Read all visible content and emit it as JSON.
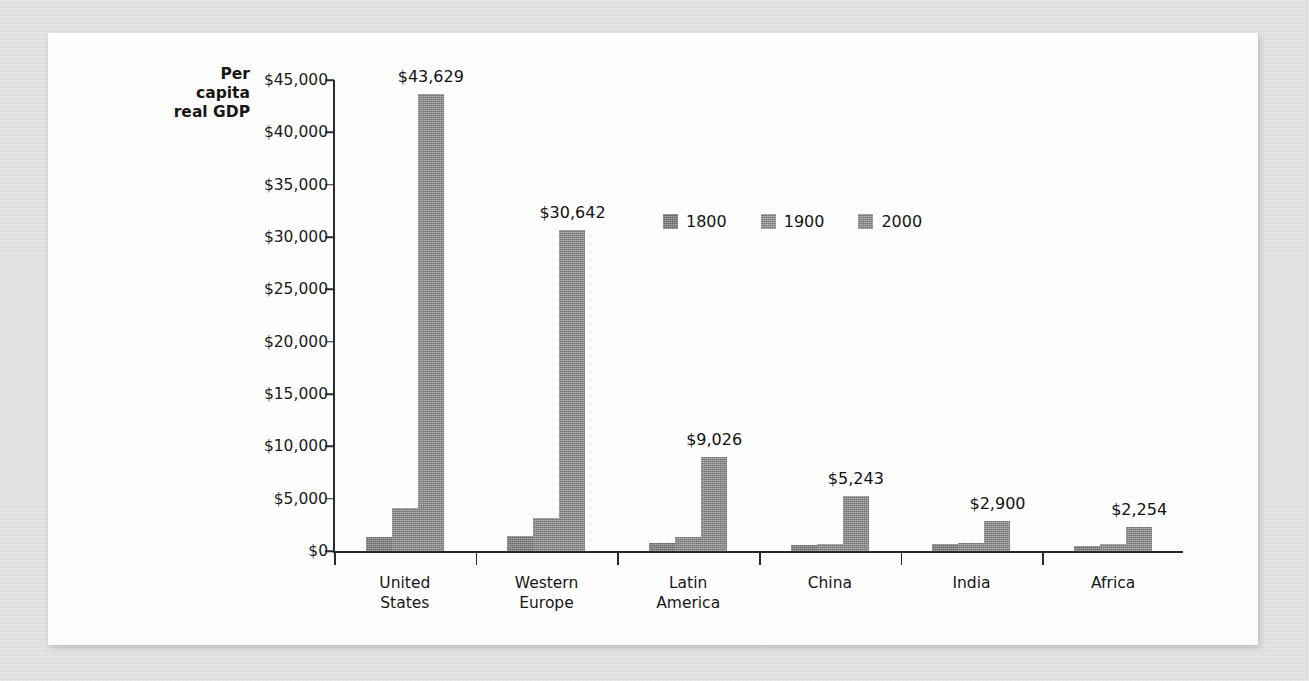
{
  "figure": {
    "background_color": "#dcdcdc",
    "card_color": "#fefefe"
  },
  "chart_data": {
    "type": "bar",
    "title": "",
    "subtitle": "",
    "xlabel": "",
    "ylabel": "Per\ncapita\nreal GDP",
    "categories": [
      "United\nStates",
      "Western\nEurope",
      "Latin\nAmerica",
      "China",
      "India",
      "Africa"
    ],
    "series": [
      {
        "name": "1800",
        "color": "#7d7d7d",
        "values": [
          1300,
          1400,
          800,
          600,
          700,
          500
        ]
      },
      {
        "name": "1900",
        "color": "#8a8a8a",
        "values": [
          4100,
          3200,
          1300,
          700,
          800,
          700
        ]
      },
      {
        "name": "2000",
        "color": "#8a8a8a",
        "values": [
          43629,
          30642,
          9026,
          5243,
          2900,
          2254
        ]
      }
    ],
    "value_labels": [
      "$43,629",
      "$30,642",
      "$9,026",
      "$5,243",
      "$2,900",
      "$2,254"
    ],
    "value_label_series": "2000",
    "ylim": [
      0,
      45000
    ],
    "ytick_values": [
      0,
      5000,
      10000,
      15000,
      20000,
      25000,
      30000,
      35000,
      40000,
      45000
    ],
    "ytick_labels": [
      "$0",
      "$5,000",
      "$10,000",
      "$15,000",
      "$20,000",
      "$25,000",
      "$30,000",
      "$35,000",
      "$40,000",
      "$45,000"
    ],
    "grid": false,
    "legend_position": "upper-center",
    "legend_entries": [
      "1800",
      "1900",
      "2000"
    ]
  }
}
